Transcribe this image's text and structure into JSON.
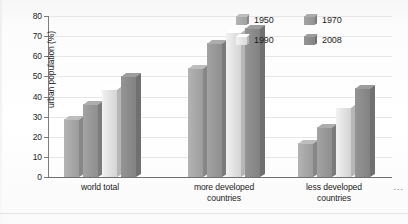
{
  "chart_data": {
    "type": "bar",
    "title": "",
    "subtitle": "",
    "xlabel": "",
    "ylabel": "urban population (%)",
    "ylim": [
      0,
      80
    ],
    "yticks": [
      0,
      10,
      20,
      30,
      40,
      50,
      60,
      70,
      80
    ],
    "ytick_labels": [
      "0",
      "10",
      "20",
      "30",
      "40",
      "50",
      "60",
      "70",
      "80"
    ],
    "grid": "horizontal",
    "legend_position": "top-right",
    "categories": [
      "world total",
      "more developed countries",
      "less developed countries"
    ],
    "series": [
      {
        "name": "1950",
        "values": [
          29,
          54,
          17
        ],
        "color": "#a9a9a9"
      },
      {
        "name": "1970",
        "values": [
          36.5,
          66.5,
          25
        ],
        "color": "#9a9a9a"
      },
      {
        "name": "1990",
        "values": [
          43.5,
          72,
          35
        ],
        "color": "#e4e4e4"
      },
      {
        "name": "2008",
        "values": [
          50,
          74,
          44
        ],
        "color": "#8c8c8c"
      }
    ],
    "annotations": [
      "..."
    ]
  },
  "axes": {
    "y_label": "urban population (%)",
    "y_ticks": [
      "80",
      "70",
      "60",
      "50",
      "40",
      "30",
      "20",
      "10",
      "0"
    ],
    "x_categories": [
      {
        "line1": "world total",
        "line2": ""
      },
      {
        "line1": "more developed",
        "line2": "countries"
      },
      {
        "line1": "less developed",
        "line2": "countries"
      }
    ]
  },
  "legend": {
    "items": [
      {
        "label": "1950"
      },
      {
        "label": "1970"
      },
      {
        "label": "1990"
      },
      {
        "label": "2008"
      }
    ]
  },
  "footer": {
    "ellipsis": "..."
  }
}
